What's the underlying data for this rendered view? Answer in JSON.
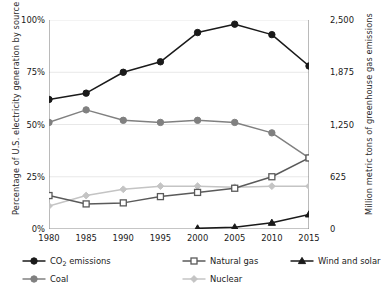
{
  "chart_data": {
    "type": "line",
    "title": "",
    "xlabel": "",
    "ylabel": "Percentage of U.S. electricity generation by source",
    "y2label": "Million metric tons of greenhouse gas emissions",
    "grid": true,
    "legend_position": "bottom",
    "x": [
      1980,
      1985,
      1990,
      1995,
      2000,
      2005,
      2010,
      2015
    ],
    "xtick_labels": [
      "1980",
      "1985",
      "1990",
      "1995",
      "2000",
      "2005",
      "2010",
      "2015"
    ],
    "ylim": [
      0,
      100
    ],
    "ytick_labels": [
      "0%",
      "25%",
      "50%",
      "75%",
      "100%"
    ],
    "ytick_values": [
      0,
      25,
      50,
      75,
      100
    ],
    "y2lim": [
      0,
      2500
    ],
    "y2tick_labels": [
      "0",
      "625",
      "1,250",
      "1,875",
      "2,500"
    ],
    "y2tick_values": [
      0,
      625,
      1250,
      1875,
      2500
    ],
    "series": [
      {
        "name": "CO2 emissions",
        "label_html": "CO<sub>2</sub> emissions",
        "axis": "right",
        "marker": "circle-filled",
        "color": "#1a1a1a",
        "values": [
          62,
          65,
          75,
          80,
          94,
          98,
          93,
          78
        ],
        "values_right_axis": [
          1550,
          1625,
          1875,
          2000,
          2350,
          2450,
          2325,
          1950
        ]
      },
      {
        "name": "Coal",
        "label_html": "Coal",
        "axis": "left",
        "marker": "circle-filled",
        "color": "#808080",
        "values": [
          51,
          57,
          52,
          51,
          52,
          51,
          46,
          34
        ]
      },
      {
        "name": "Natural gas",
        "label_html": "Natural gas",
        "axis": "left",
        "marker": "square-open",
        "color": "#5a5a5a",
        "values": [
          16,
          12,
          12.5,
          15.5,
          17.5,
          19.5,
          25,
          34
        ]
      },
      {
        "name": "Nuclear",
        "label_html": "Nuclear",
        "axis": "left",
        "marker": "diamond-filled",
        "color": "#c4c4c4",
        "values": [
          11,
          16,
          19,
          20.5,
          20.5,
          20,
          20.5,
          20.5
        ]
      },
      {
        "name": "Wind and solar",
        "label_html": "Wind and solar",
        "axis": "left",
        "marker": "triangle-filled",
        "color": "#1a1a1a",
        "values": [
          null,
          null,
          null,
          null,
          0.3,
          0.8,
          3,
          7
        ]
      }
    ]
  },
  "colors": {
    "co2": "#1a1a1a",
    "coal": "#808080",
    "natural_gas": "#5a5a5a",
    "nuclear": "#c4c4c4",
    "wind_solar": "#1a1a1a",
    "axis": "#8c8c8c",
    "grid": "#e8e8e8",
    "text": "#1a1a1a"
  }
}
